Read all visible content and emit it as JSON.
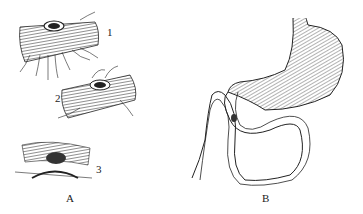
{
  "figure": {
    "panels": [
      {
        "id": "A",
        "label": "A",
        "subfigures": [
          {
            "number": "1",
            "description": "bowel segment with perforation and radial sutures"
          },
          {
            "number": "2",
            "description": "bowel segment with perforation being sutured"
          },
          {
            "number": "3",
            "description": "opened bowel wall with lesion"
          }
        ]
      },
      {
        "id": "B",
        "label": "B",
        "description": "stomach with duodenum and jejunal loop, lesion marked"
      }
    ],
    "colors": {
      "ink": "#1a1a1a",
      "background": "#ffffff"
    }
  }
}
